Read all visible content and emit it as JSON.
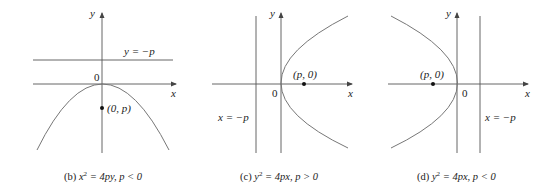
{
  "figure": {
    "panels": [
      {
        "id": "b",
        "caption_prefix": "(b) ",
        "caption_lhs": "x",
        "caption_exp": "2",
        "caption_rest": " = 4py, p < 0",
        "axis_x_label": "x",
        "axis_y_label": "y",
        "origin_label": "0",
        "directrix_label": "y = −p",
        "focus_label": "(0, p)"
      },
      {
        "id": "c",
        "caption_prefix": "(c) ",
        "caption_lhs": "y",
        "caption_exp": "2",
        "caption_rest": " = 4px, p > 0",
        "axis_x_label": "x",
        "axis_y_label": "y",
        "origin_label": "0",
        "directrix_label": "x = −p",
        "focus_label": "(p, 0)"
      },
      {
        "id": "d",
        "caption_prefix": "(d) ",
        "caption_lhs": "y",
        "caption_exp": "2",
        "caption_rest": " = 4px, p < 0",
        "axis_x_label": "x",
        "axis_y_label": "y",
        "origin_label": "0",
        "directrix_label": "x = −p",
        "focus_label": "(p, 0)"
      }
    ],
    "colors": {
      "axis": "#555555",
      "curve": "#777777",
      "text": "#222222",
      "background": "#ffffff"
    }
  }
}
